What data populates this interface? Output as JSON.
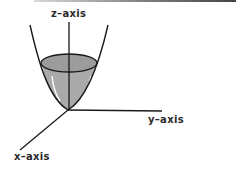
{
  "diagram": {
    "labels": {
      "z_axis": "z–axis",
      "y_axis": "y–axis",
      "x_axis": "x–axis"
    },
    "colors": {
      "stroke": "#1a1a1a",
      "fill": "#a8a8a8",
      "rim_fill": "#9a9a9a",
      "highlight": "#ffffff",
      "background": "#ffffff"
    },
    "shape": "paraboloid (bowl) opening upward along z-axis, with elliptical cross-section shaded"
  }
}
